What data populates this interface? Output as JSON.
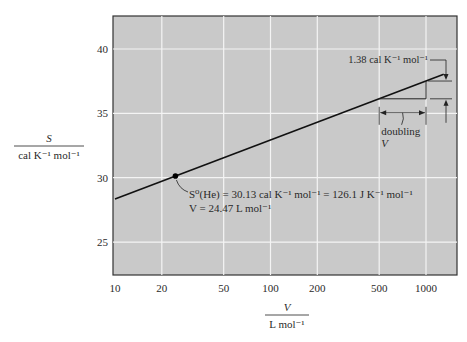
{
  "chart_data": {
    "type": "line",
    "title": "",
    "xlabel": "V / L mol⁻¹",
    "ylabel": "S / cal K⁻¹ mol⁻¹",
    "xscale": "log",
    "xlim": [
      10,
      1400
    ],
    "ylim": [
      22.5,
      42.5
    ],
    "x_ticks": [
      10,
      20,
      50,
      100,
      200,
      500,
      1000
    ],
    "x_tick_labels": [
      "10",
      "20",
      "50",
      "100",
      "200",
      "500",
      "1000"
    ],
    "y_ticks": [
      25,
      30,
      35,
      40
    ],
    "y_tick_labels": [
      "25",
      "30",
      "35",
      "40"
    ],
    "grid": true,
    "series": [
      {
        "name": "S vs V (He)",
        "x": [
          10,
          24.47,
          100,
          500,
          1000,
          1300
        ],
        "y": [
          28.35,
          30.13,
          32.93,
          36.13,
          37.51,
          38.03
        ]
      }
    ],
    "highlight_point": {
      "x": 24.47,
      "y": 30.13
    },
    "annotations": [
      "S⁰(He) = 30.13 cal K⁻¹ mol⁻¹ = 126.1 J K⁻¹ mol⁻¹",
      "V = 24.47 L mol⁻¹",
      "1.38 cal K⁻¹ mol⁻¹",
      "doubling V"
    ]
  },
  "labels": {
    "y_num": "S",
    "y_den": "cal K⁻¹ mol⁻¹",
    "x_num": "V",
    "x_den": "L mol⁻¹",
    "ann1": "S⁰(He) = 30.13 cal K⁻¹ mol⁻¹ = 126.1 J K⁻¹ mol⁻¹",
    "ann2": "V = 24.47 L mol⁻¹",
    "delta": "1.38 cal K⁻¹ mol⁻¹",
    "doubling": "doubling",
    "doubling_v": "V"
  },
  "colors": {
    "plot_bg": "#c9c9c9",
    "grid": "#f4f4f4",
    "line": "#111111",
    "frame": "#333333"
  }
}
